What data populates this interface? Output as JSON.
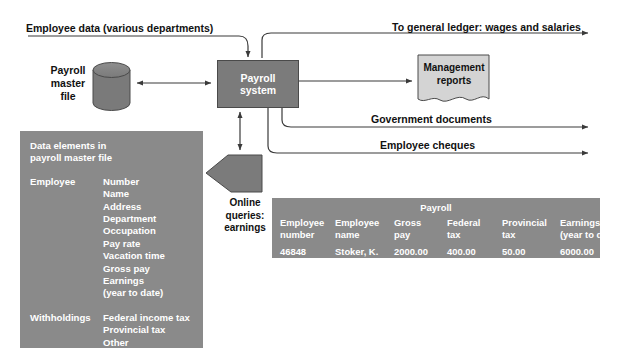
{
  "diagram": {
    "colors": {
      "process_fill": "#7b7b7b",
      "panel_fill": "#8a8a8a",
      "store_fill": "#7a7a7a",
      "document_fill": "#d4d4d4",
      "line": "#3a3a3a",
      "text_on_gray": "#ffffff",
      "text": "#111111"
    },
    "process": {
      "line1": "Payroll",
      "line2": "system"
    },
    "data_store": {
      "line1": "Payroll",
      "line2": "master",
      "line3": "file"
    },
    "document": {
      "line1": "Management",
      "line2": "reports"
    },
    "query": {
      "line1": "Online",
      "line2": "queries:",
      "line3": "earnings"
    },
    "flows": {
      "employee_data": "Employee data (various departments)",
      "general_ledger": "To general ledger: wages and salaries",
      "government_documents": "Government documents",
      "employee_cheques": "Employee cheques"
    }
  },
  "data_elements": {
    "title_line1": "Data elements in",
    "title_line2": "payroll master file",
    "groups": [
      {
        "key": "Employee",
        "values": [
          "Number",
          "Name",
          "Address",
          "Department",
          "Occupation",
          "Pay rate",
          "Vacation time",
          "Gross pay",
          "Earnings",
          "(year to date)"
        ]
      },
      {
        "key": "Withholdings",
        "values": [
          "Federal income tax",
          "Provincial tax",
          "Other"
        ]
      }
    ]
  },
  "payroll_table": {
    "title": "Payroll",
    "columns": [
      {
        "header_line1": "Employee",
        "header_line2": "number",
        "value": "46848"
      },
      {
        "header_line1": "Employee",
        "header_line2": "name",
        "value": "Stoker, K."
      },
      {
        "header_line1": "Gross",
        "header_line2": "pay",
        "value": "2000.00"
      },
      {
        "header_line1": "Federal",
        "header_line2": "tax",
        "value": "400.00"
      },
      {
        "header_line1": "Provincial",
        "header_line2": "tax",
        "value": "50.00"
      },
      {
        "header_line1": "Earnings",
        "header_line2": "(year to date)",
        "value": "6000.00"
      }
    ]
  }
}
